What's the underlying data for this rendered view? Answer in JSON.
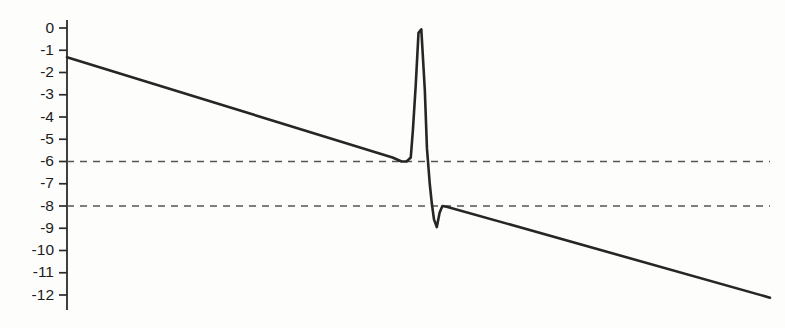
{
  "chart_data": {
    "type": "line",
    "title": "",
    "subtitle": "",
    "xlabel": "",
    "ylabel": "",
    "grid": false,
    "legend": null,
    "axis": {
      "y_visible": true,
      "x_visible": false,
      "ytick_labels": [
        "0",
        "-1",
        "-2",
        "-3",
        "-4",
        "-5",
        "-6",
        "-7",
        "-8",
        "-9",
        "-10",
        "-11",
        "-12"
      ],
      "ytick_values": [
        0,
        -1,
        -2,
        -3,
        -4,
        -5,
        -6,
        -7,
        -8,
        -9,
        -10,
        -11,
        -12
      ],
      "ylim": [
        -12.4,
        0.35
      ],
      "xlim": [
        0,
        100
      ]
    },
    "annotations": [
      {
        "name": "threshold-line-upper",
        "type": "horizontal-dashed",
        "value": -6
      },
      {
        "name": "threshold-line-lower",
        "type": "horizontal-dashed",
        "value": -8
      }
    ],
    "series": [
      {
        "name": "signal",
        "color": "#262626",
        "style": "solid",
        "linewidth": 2.6,
        "x": [
          0.0,
          46.3,
          47.6,
          48.3,
          48.9,
          49.2,
          49.6,
          50.0,
          50.4,
          50.9,
          51.2,
          51.6,
          51.9,
          52.2,
          52.6,
          53.0,
          53.4,
          54.0,
          100.0
        ],
        "y": [
          -1.31,
          -5.82,
          -6.0,
          -6.0,
          -5.82,
          -4.6,
          -2.6,
          -0.22,
          -0.06,
          -2.8,
          -5.4,
          -7.0,
          -7.9,
          -8.6,
          -8.95,
          -8.3,
          -8.0,
          -8.03,
          -12.12
        ]
      }
    ],
    "peak": {
      "name": "spike-apex",
      "x": 50.0,
      "y": -0.06
    },
    "trough": {
      "name": "spike-trough",
      "x": 52.6,
      "y": -8.95
    },
    "baseline_left": {
      "name": "plateau-upper",
      "value": -6.0
    },
    "baseline_right": {
      "name": "plateau-lower",
      "value": -8.0
    }
  },
  "colors": {
    "line": "#262626",
    "axis": "#2b2b2b",
    "dashed": "#555555",
    "text": "#1c1c1c",
    "background": "#fdfdfc"
  }
}
